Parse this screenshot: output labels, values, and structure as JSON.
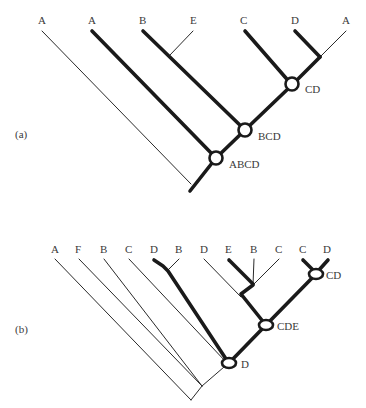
{
  "panel_a": {
    "label": "(a)",
    "taxa": [
      "A",
      "A",
      "B",
      "E",
      "C",
      "D",
      "A"
    ],
    "nodes": {
      "cd": "CD",
      "bcd": "BCD",
      "abcd": "ABCD"
    }
  },
  "panel_b": {
    "label": "(b)",
    "taxa": [
      "A",
      "F",
      "B",
      "C",
      "D",
      "B",
      "D",
      "E",
      "B",
      "C",
      "C",
      "D"
    ],
    "nodes": {
      "cd": "CD",
      "cde": "CDE",
      "d": "D"
    }
  },
  "colors": {
    "line": "#1a1a1a",
    "text": "#3a3a3a",
    "background": "#ffffff"
  }
}
